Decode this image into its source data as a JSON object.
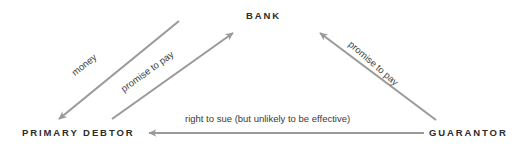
{
  "diagram": {
    "background_color": "#ffffff",
    "line_color": "#9a9a9a",
    "node_text_color": "#2b2b2b",
    "edge_text_color": "#3a3a3a",
    "nodes": [
      {
        "id": "bank",
        "label": "BANK"
      },
      {
        "id": "primary_debtor",
        "label": "PRIMARY DEBTOR"
      },
      {
        "id": "guarantor",
        "label": "GUARANTOR"
      }
    ],
    "edges": [
      {
        "id": "money",
        "label": "money",
        "from": "bank",
        "to": "primary_debtor",
        "direction": "down-left"
      },
      {
        "id": "promise_to_pay_debtor",
        "label": "promise to pay",
        "from": "primary_debtor",
        "to": "bank",
        "direction": "up-right"
      },
      {
        "id": "promise_to_pay_guarantor",
        "label": "promise to pay",
        "from": "guarantor",
        "to": "bank",
        "direction": "up-left"
      },
      {
        "id": "right_to_sue",
        "label": "right to sue (but unlikely to be effective)",
        "from": "guarantor",
        "to": "primary_debtor",
        "direction": "left"
      }
    ]
  }
}
